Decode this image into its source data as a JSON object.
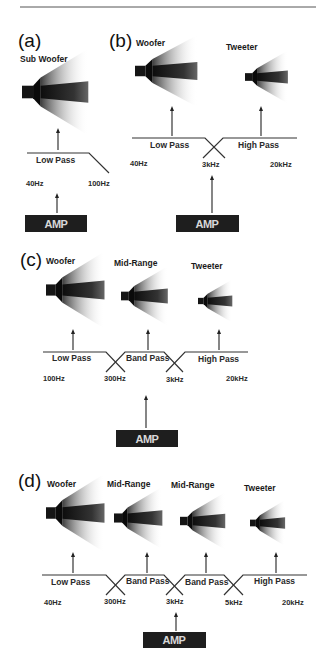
{
  "colors": {
    "background": "#ffffff",
    "ink": "#222222",
    "amp_box": "#1e1e1e",
    "amp_text": "#d8d8d8",
    "speaker_dark": "#111111"
  },
  "top_rule": true,
  "panels": [
    {
      "id": "a",
      "label": "(a)",
      "speakers": [
        {
          "label": "Sub Woofer",
          "filter": "Low Pass"
        }
      ],
      "frequencies": [
        "40Hz",
        "100Hz"
      ],
      "amp": "AMP"
    },
    {
      "id": "b",
      "label": "(b)",
      "speakers": [
        {
          "label": "Woofer",
          "filter": "Low Pass"
        },
        {
          "label": "Tweeter",
          "filter": "High Pass"
        }
      ],
      "frequencies": [
        "40Hz",
        "3kHz",
        "20kHz"
      ],
      "amp": "AMP"
    },
    {
      "id": "c",
      "label": "(c)",
      "speakers": [
        {
          "label": "Woofer",
          "filter": "Low Pass"
        },
        {
          "label": "Mid-Range",
          "filter": "Band Pass"
        },
        {
          "label": "Tweeter",
          "filter": "High Pass"
        }
      ],
      "frequencies": [
        "100Hz",
        "300Hz",
        "3kHz",
        "20kHz"
      ],
      "amp": "AMP"
    },
    {
      "id": "d",
      "label": "(d)",
      "speakers": [
        {
          "label": "Woofer",
          "filter": "Low Pass"
        },
        {
          "label": "Mid-Range",
          "filter": "Band Pass"
        },
        {
          "label": "Mid-Range",
          "filter": "Band Pass"
        },
        {
          "label": "Tweeter",
          "filter": "High Pass"
        }
      ],
      "frequencies": [
        "40Hz",
        "300Hz",
        "3kHz",
        "5kHz",
        "20kHz"
      ],
      "amp": "AMP"
    }
  ]
}
